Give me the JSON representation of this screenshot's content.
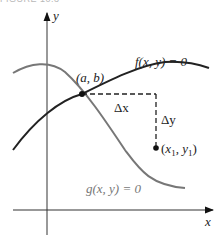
{
  "caption": "FIGURE 10.3",
  "axes": {
    "x_label": "x",
    "y_label": "y"
  },
  "curves": {
    "f": {
      "label": "f(x, y) = 0",
      "color": "#222222"
    },
    "g": {
      "label": "g(x, y) = 0",
      "color": "#777777"
    }
  },
  "points": {
    "intersection": {
      "label": "(a, b)"
    },
    "target": {
      "label_x": "x",
      "label_sub1": "1",
      "label_y": "y",
      "label_sub2": "1"
    }
  },
  "deltas": {
    "dx": "Δx",
    "dy": "Δy"
  }
}
